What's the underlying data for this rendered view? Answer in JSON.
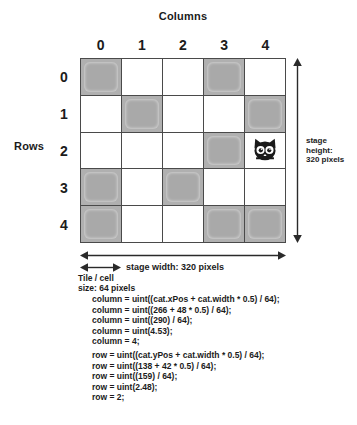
{
  "diagram": {
    "columns_title": "Columns",
    "rows_title": "Rows",
    "column_headers": [
      "0",
      "1",
      "2",
      "3",
      "4"
    ],
    "row_headers": [
      "0",
      "1",
      "2",
      "3",
      "4"
    ],
    "grid": {
      "rows": 5,
      "columns": 5,
      "filled_cells": [
        [
          true,
          false,
          false,
          true,
          false
        ],
        [
          false,
          true,
          false,
          false,
          true
        ],
        [
          false,
          false,
          false,
          true,
          false
        ],
        [
          true,
          false,
          true,
          false,
          false
        ],
        [
          true,
          false,
          false,
          true,
          true
        ]
      ],
      "sprite": {
        "name": "cat",
        "row": 2,
        "column": 4
      }
    },
    "annotations": {
      "stage_height": "stage\nheight:\n320 pixels",
      "stage_width": "stage width: 320 pixels",
      "tile_size": "Tile / cell\nsize: 64 pixels"
    },
    "code": {
      "column_lines": "column = uint((cat.xPos + cat.width * 0.5) / 64);\ncolumn = uint((266 + 48 * 0.5) / 64);\ncolumn = uint((290) / 64);\ncolumn = uint(4.53);\ncolumn = 4;",
      "row_lines": "row = uint((cat.yPos + cat.width * 0.5) / 64);\nrow = uint((138 + 42 * 0.5) / 64);\nrow = uint((159) / 64);\nrow = uint(2.48);\nrow = 2;"
    },
    "colors": {
      "filled_cell": "#b0b0b0",
      "grid_line": "#4a4a4a",
      "background": "#ffffff",
      "text": "#1b1b1b"
    }
  }
}
